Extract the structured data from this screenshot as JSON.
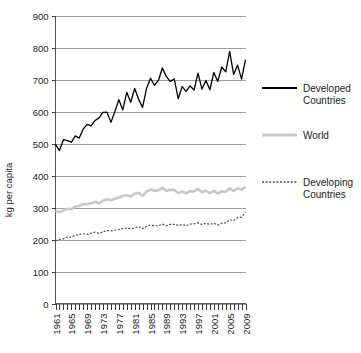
{
  "chart_data": {
    "type": "line",
    "title": "",
    "xlabel": "",
    "ylabel": "kg per capita",
    "ylim": [
      0,
      900
    ],
    "ytick_values": [
      0,
      100,
      200,
      300,
      400,
      500,
      600,
      700,
      800,
      900
    ],
    "ytick_labels": [
      "0",
      "100",
      "200",
      "300",
      "400",
      "500",
      "600",
      "700",
      "800",
      "900"
    ],
    "grid": true,
    "legend_position": "right",
    "xlim": [
      1961,
      2009
    ],
    "x": [
      1961,
      1962,
      1963,
      1964,
      1965,
      1966,
      1967,
      1968,
      1969,
      1970,
      1971,
      1972,
      1973,
      1974,
      1975,
      1976,
      1977,
      1978,
      1979,
      1980,
      1981,
      1982,
      1983,
      1984,
      1985,
      1986,
      1987,
      1988,
      1989,
      1990,
      1991,
      1992,
      1993,
      1994,
      1995,
      1996,
      1997,
      1998,
      1999,
      2000,
      2001,
      2002,
      2003,
      2004,
      2005,
      2006,
      2007,
      2008,
      2009
    ],
    "xtick_labels": [
      "1961",
      "1965",
      "1969",
      "1973",
      "1977",
      "1981",
      "1985",
      "1989",
      "1993",
      "1997",
      "2001",
      "2005",
      "2009"
    ],
    "xtick_values": [
      1961,
      1965,
      1969,
      1973,
      1977,
      1981,
      1985,
      1989,
      1993,
      1997,
      2001,
      2005,
      2009
    ],
    "xtick_interval": 4,
    "minor_tick_interval": 1,
    "series": [
      {
        "name": "Developed Countries",
        "style": "solid",
        "color": "#000000",
        "width": 1.3,
        "values": [
          497,
          478,
          512,
          509,
          504,
          524,
          517,
          545,
          560,
          555,
          572,
          580,
          597,
          598,
          566,
          600,
          637,
          605,
          660,
          629,
          672,
          638,
          613,
          672,
          704,
          682,
          697,
          736,
          709,
          694,
          702,
          640,
          678,
          663,
          680,
          667,
          720,
          670,
          697,
          668,
          722,
          694,
          739,
          724,
          788,
          716,
          745,
          701,
          762
        ]
      },
      {
        "name": "World",
        "style": "solid",
        "color": "#c8c8c8",
        "width": 2.6,
        "values": [
          289,
          285,
          291,
          296,
          295,
          303,
          305,
          310,
          310,
          313,
          318,
          313,
          321,
          326,
          323,
          327,
          331,
          336,
          338,
          334,
          343,
          346,
          336,
          350,
          356,
          352,
          354,
          362,
          352,
          355,
          355,
          345,
          350,
          344,
          351,
          350,
          358,
          348,
          352,
          345,
          352,
          344,
          350,
          349,
          360,
          352,
          360,
          356,
          365
        ]
      },
      {
        "name": "Developing Countries",
        "style": "dashed",
        "color": "#4a4a4a",
        "width": 1.2,
        "values": [
          196,
          200,
          202,
          208,
          207,
          213,
          216,
          218,
          216,
          220,
          223,
          219,
          224,
          228,
          227,
          229,
          231,
          234,
          236,
          233,
          236,
          240,
          234,
          241,
          245,
          243,
          243,
          248,
          243,
          247,
          247,
          244,
          247,
          243,
          248,
          249,
          252,
          247,
          251,
          247,
          251,
          245,
          251,
          252,
          262,
          259,
          268,
          270,
          285
        ]
      }
    ]
  },
  "legend": {
    "entries": [
      {
        "label_line1": "Developed",
        "label_line2": "Countries"
      },
      {
        "label_line1": "World",
        "label_line2": ""
      },
      {
        "label_line1": "Developing",
        "label_line2": "Countries"
      }
    ]
  }
}
